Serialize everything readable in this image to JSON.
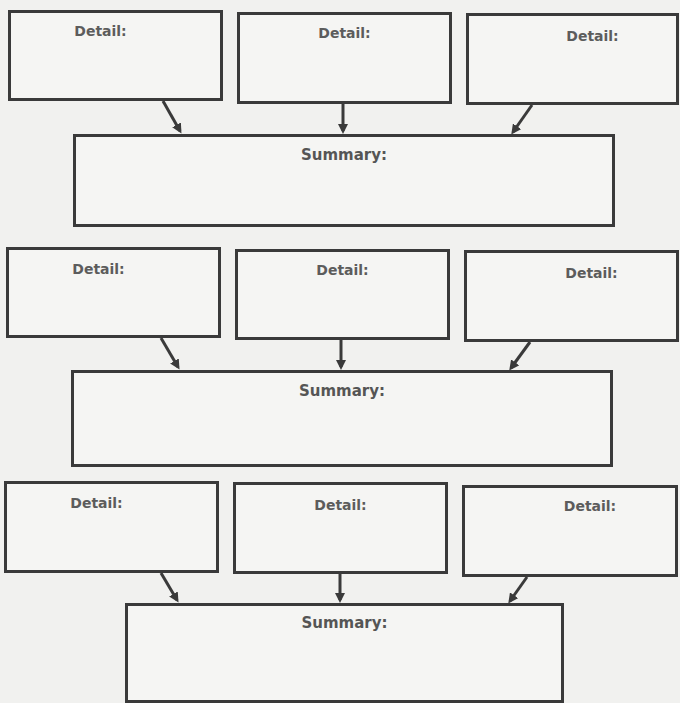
{
  "organizer": {
    "groups": [
      {
        "details": [
          {
            "label": "Detail:"
          },
          {
            "label": "Detail:"
          },
          {
            "label": "Detail:"
          }
        ],
        "summary": {
          "label": "Summary:"
        }
      },
      {
        "details": [
          {
            "label": "Detail:"
          },
          {
            "label": "Detail:"
          },
          {
            "label": "Detail:"
          }
        ],
        "summary": {
          "label": "Summary:"
        }
      },
      {
        "details": [
          {
            "label": "Detail:"
          },
          {
            "label": "Detail:"
          },
          {
            "label": "Detail:"
          }
        ],
        "summary": {
          "label": "Summary:"
        }
      }
    ]
  }
}
